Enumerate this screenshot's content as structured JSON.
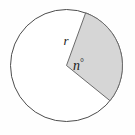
{
  "figure": {
    "name": "circle-with-shaded-sector",
    "type": "geometry-diagram",
    "background_color": "#fefefe",
    "circle": {
      "name": "circle-outline",
      "center_x": 66.5,
      "center_y": 65.5,
      "radius": 56,
      "stroke_color": "#4d4d4d",
      "stroke_width": 1,
      "fill_color": "#ffffff"
    },
    "sector": {
      "name": "shaded-sector",
      "fill_color": "#d6d6d6",
      "stroke_color": "#6b6b6b",
      "stroke_width": 1,
      "start_angle_deg": -70,
      "end_angle_deg": 39,
      "central_angle_deg": 109,
      "start_point_x": 85.7,
      "start_point_y": 12.9,
      "end_point_x": 110.0,
      "end_point_y": 100.7
    },
    "labels": {
      "radius": {
        "name": "radius-label",
        "text": "r",
        "x": 66,
        "y": 45,
        "color": "#1b1b1b"
      },
      "angle": {
        "name": "angle-label",
        "text": "n",
        "degree_symbol": "°",
        "x": 73,
        "y": 70,
        "color": "#1b1b1b"
      }
    }
  }
}
